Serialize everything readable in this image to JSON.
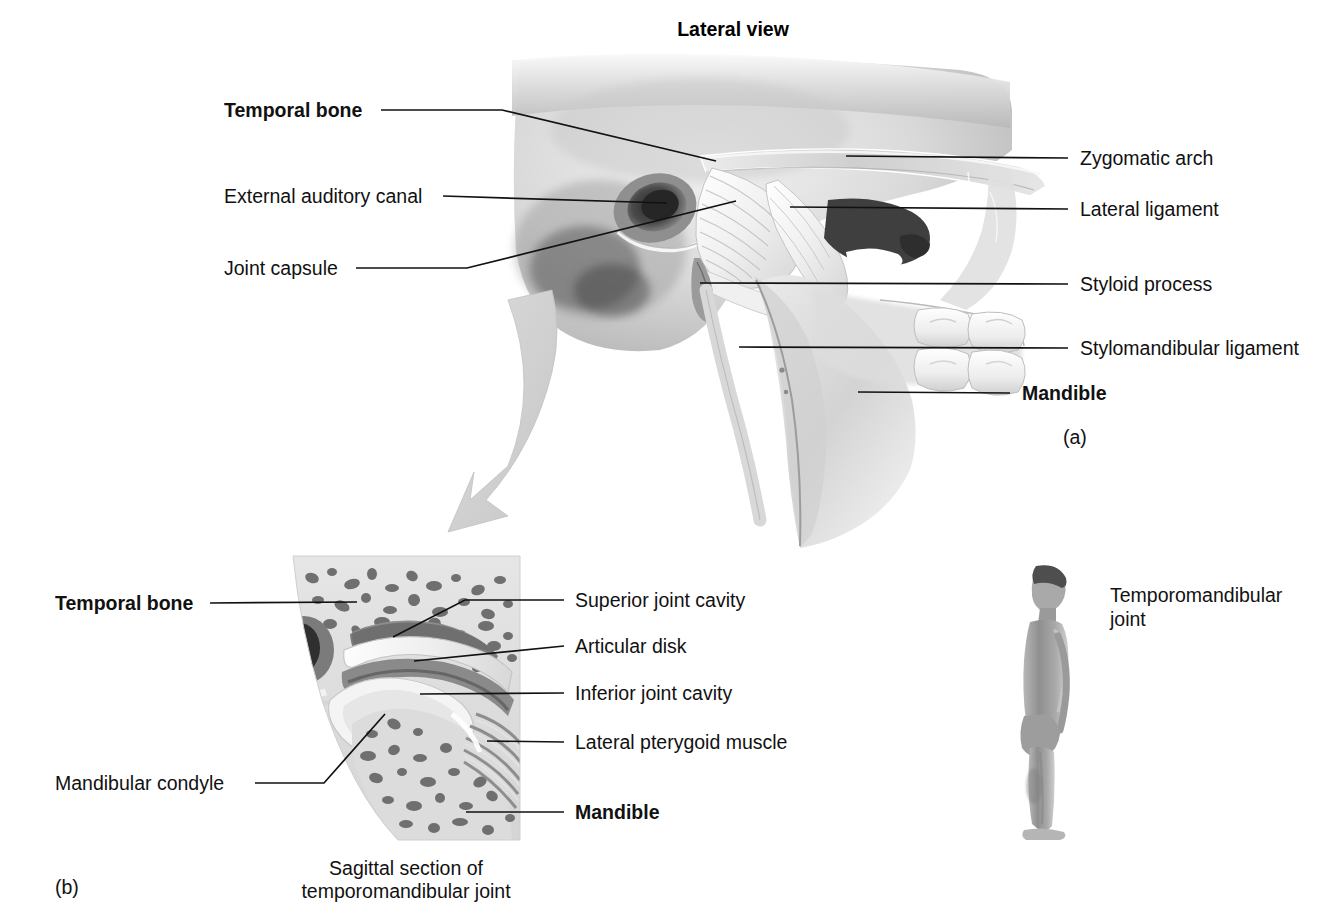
{
  "figure": {
    "title": "Lateral view",
    "panel_a_marker": "(a)",
    "panel_b_marker": "(b)",
    "panel_b_caption_line1": "Sagittal section of",
    "panel_b_caption_line2": "temporomandibular joint",
    "orientation_label_line1": "Temporomandibular",
    "orientation_label_line2": "joint"
  },
  "panel_a": {
    "left_labels": [
      {
        "text": "Temporal bone",
        "bold": true
      },
      {
        "text": "External auditory canal",
        "bold": false
      },
      {
        "text": "Joint capsule",
        "bold": false
      }
    ],
    "right_labels": [
      {
        "text": "Zygomatic arch",
        "bold": false
      },
      {
        "text": "Lateral ligament",
        "bold": false
      },
      {
        "text": "Styloid process",
        "bold": false
      },
      {
        "text": "Stylomandibular ligament",
        "bold": false
      },
      {
        "text": "Mandible",
        "bold": true
      }
    ]
  },
  "panel_b": {
    "left_labels": [
      {
        "text": "Temporal bone",
        "bold": true
      },
      {
        "text": "Mandibular condyle",
        "bold": false
      }
    ],
    "right_labels": [
      {
        "text": "Superior joint cavity",
        "bold": false
      },
      {
        "text": "Articular disk",
        "bold": false
      },
      {
        "text": "Inferior joint cavity",
        "bold": false
      },
      {
        "text": "Lateral pterygoid muscle",
        "bold": false
      },
      {
        "text": "Mandible",
        "bold": true
      }
    ]
  },
  "colors": {
    "background": "#ffffff",
    "text": "#111111",
    "leader_line": "#111111",
    "arrow": "#d2d2d2",
    "bone_light": "#e2e2e2",
    "bone_mid": "#bdbdbd",
    "bone_dark": "#6e6e6e",
    "cavity_dark": "#3a3a3a"
  }
}
